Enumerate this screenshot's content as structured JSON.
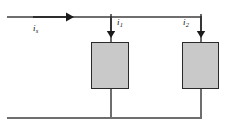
{
  "figure": {
    "type": "circuit-diagram",
    "background_color": "#ffffff",
    "wire_color": "#6e6e6e",
    "resistor_fill": "#c9c9c9",
    "resistor_border": "#2b2b2b",
    "arrow_color": "#1a1a1a",
    "label_color": "#111111"
  },
  "labels": {
    "source_current": {
      "symbol": "i",
      "subscript": "s"
    },
    "branch1_current": {
      "symbol": "i",
      "subscript": "1"
    },
    "branch2_current": {
      "symbol": "i",
      "subscript": "2"
    }
  },
  "arrows": {
    "source": {
      "direction": "right"
    },
    "branch1": {
      "direction": "down"
    },
    "branch2": {
      "direction": "down"
    }
  },
  "components": {
    "resistor1": {
      "name": "left-resistor"
    },
    "resistor2": {
      "name": "right-resistor"
    }
  }
}
